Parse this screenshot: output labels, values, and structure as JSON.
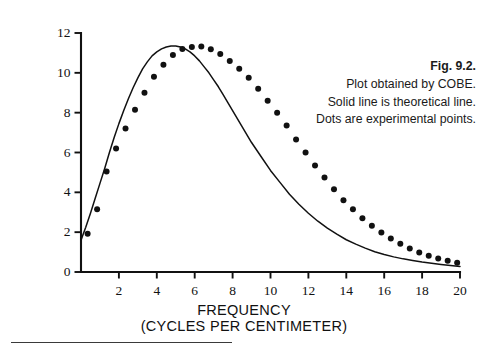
{
  "figure": {
    "background_color": "#ffffff",
    "ink_color": "#111111"
  },
  "caption": {
    "title": "Fig. 9.2.",
    "lines": [
      "Plot obtained by COBE.",
      "Solid line is theoretical line.",
      "Dots are experimental points."
    ]
  },
  "axes": {
    "x_title_line1": "FREQUENCY",
    "x_title_line2": "(CYCLES PER CENTIMETER)",
    "y_title": "RELATIVE INTENSITY",
    "x_tick_labels": [
      "2",
      "4",
      "6",
      "8",
      "10",
      "12",
      "14",
      "16",
      "18",
      "20"
    ],
    "y_tick_labels": [
      "0",
      "2",
      "4",
      "6",
      "8",
      "10",
      "12"
    ]
  },
  "chart_data": {
    "type": "line",
    "title": "Fig. 9.2.",
    "subtitle": "Plot obtained by COBE. Solid line is theoretical line. Dots are experimental points.",
    "xlabel": "FREQUENCY (CYCLES PER CENTIMETER)",
    "ylabel": "RELATIVE INTENSITY",
    "xlim": [
      0,
      20
    ],
    "ylim": [
      0,
      12
    ],
    "xticks": [
      0,
      2,
      4,
      6,
      8,
      10,
      12,
      14,
      16,
      18,
      20
    ],
    "yticks": [
      0,
      2,
      4,
      6,
      8,
      10,
      12
    ],
    "grid": false,
    "legend": null,
    "series": [
      {
        "name": "Theoretical line",
        "style": "solid-line",
        "color": "#111111",
        "x": [
          0.0,
          0.25,
          0.5,
          0.75,
          1.0,
          1.25,
          1.5,
          1.75,
          2.0,
          2.25,
          2.5,
          2.75,
          3.0,
          3.25,
          3.5,
          3.75,
          4.0,
          4.25,
          4.5,
          4.75,
          5.0,
          5.25,
          5.5,
          5.75,
          6.0,
          6.25,
          6.5,
          6.75,
          7.0,
          7.25,
          7.5,
          7.75,
          8.0,
          8.5,
          9.0,
          9.5,
          10.0,
          10.5,
          11.0,
          11.5,
          12.0,
          12.5,
          13.0,
          13.5,
          14.0,
          14.5,
          15.0,
          15.5,
          16.0,
          16.5,
          17.0,
          17.5,
          18.0,
          18.5,
          19.0,
          19.5,
          20.0
        ],
        "y": [
          1.6,
          2.25,
          2.95,
          3.7,
          4.45,
          5.2,
          6.0,
          6.75,
          7.45,
          8.1,
          8.7,
          9.25,
          9.75,
          10.2,
          10.55,
          10.85,
          11.05,
          11.2,
          11.3,
          11.35,
          11.35,
          11.3,
          11.2,
          11.05,
          10.85,
          10.6,
          10.3,
          10.0,
          9.65,
          9.3,
          8.9,
          8.5,
          8.1,
          7.3,
          6.5,
          5.8,
          5.1,
          4.5,
          3.9,
          3.4,
          2.95,
          2.55,
          2.2,
          1.9,
          1.62,
          1.4,
          1.2,
          1.02,
          0.88,
          0.76,
          0.66,
          0.58,
          0.5,
          0.44,
          0.38,
          0.33,
          0.28
        ]
      },
      {
        "name": "Experimental points",
        "style": "filled-circles",
        "color": "#111111",
        "x": [
          0.35,
          0.85,
          1.35,
          1.85,
          2.35,
          2.85,
          3.35,
          3.85,
          4.35,
          4.85,
          5.35,
          5.85,
          6.35,
          6.85,
          7.35,
          7.85,
          8.35,
          8.85,
          9.35,
          9.85,
          10.35,
          10.85,
          11.35,
          11.85,
          12.35,
          12.85,
          13.35,
          13.85,
          14.35,
          14.85,
          15.35,
          15.85,
          16.35,
          16.85,
          17.35,
          17.85,
          18.35,
          18.85,
          19.35,
          19.85
        ],
        "y": [
          1.92,
          3.15,
          5.05,
          6.2,
          7.2,
          8.15,
          9.0,
          9.8,
          10.4,
          10.9,
          11.2,
          11.3,
          11.32,
          11.18,
          10.95,
          10.6,
          10.2,
          9.75,
          9.2,
          8.6,
          8.0,
          7.35,
          6.65,
          6.0,
          5.35,
          4.75,
          4.15,
          3.6,
          3.15,
          2.7,
          2.32,
          1.98,
          1.68,
          1.42,
          1.18,
          0.98,
          0.82,
          0.68,
          0.56,
          0.46
        ]
      }
    ]
  }
}
